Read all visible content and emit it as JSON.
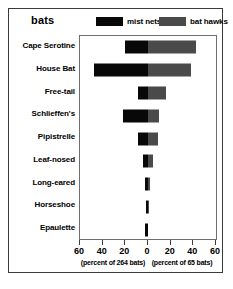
{
  "chart_title": "bats",
  "legend": {
    "items": [
      {
        "label": "mist nets",
        "color": "#080808",
        "icon": "legend-swatch-black"
      },
      {
        "label": "bat hawks",
        "color": "#4a4a4a",
        "icon": "legend-swatch-gray"
      }
    ]
  },
  "axis": {
    "tick_labels_left": [
      "60",
      "40",
      "20"
    ],
    "tick_labels_center": "0",
    "tick_labels_right": [
      "20",
      "40",
      "60"
    ],
    "caption_left": "(percent of 264 bats)",
    "caption_right": "(percent of 65 bats)"
  },
  "chart_data": {
    "type": "bar",
    "orientation": "horizontal",
    "subtype": "diverging-bidirectional",
    "title": "bats",
    "xlabel": "",
    "ylabel": "",
    "grid": false,
    "legend_position": "top-right",
    "xlim": [
      -60,
      60
    ],
    "xticks": [
      -60,
      -40,
      -20,
      0,
      20,
      40,
      60
    ],
    "xtick_labels": [
      "60",
      "40",
      "20",
      "0",
      "20",
      "40",
      "60"
    ],
    "axis_note_left": "(percent of 264 bats)",
    "axis_note_right": "(percent of 65 bats)",
    "categories": [
      "Cape Serotine",
      "House Bat",
      "Free-tail",
      "Schlieffen's",
      "Pipistrelle",
      "Leaf-nosed",
      "Long-eared",
      "Horseshoe",
      "Epaulette"
    ],
    "series": [
      {
        "name": "mist nets",
        "direction": "left",
        "color": "#080808",
        "unit": "percent",
        "total_n": 264,
        "values": [
          20,
          48,
          9,
          22,
          9,
          4,
          3,
          2,
          3
        ]
      },
      {
        "name": "bat hawks",
        "direction": "right",
        "color": "#4a4a4a",
        "unit": "percent",
        "total_n": 65,
        "values": [
          42,
          38,
          16,
          10,
          9,
          4,
          2,
          1,
          0
        ]
      }
    ]
  }
}
